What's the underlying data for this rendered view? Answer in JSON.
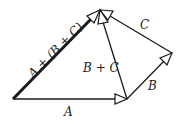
{
  "labels": {
    "A": "A",
    "B": "B",
    "C": "C",
    "B_plus_C": "B + C",
    "A_plus_B_plus_C": "A + (B + C)"
  },
  "vectors": [
    {
      "name": "A",
      "from": [
        13,
        99
      ],
      "to": [
        127,
        99
      ]
    },
    {
      "name": "B",
      "from": [
        127,
        99
      ],
      "to": [
        172,
        53
      ]
    },
    {
      "name": "C",
      "from": [
        172,
        53
      ],
      "to": [
        100,
        10
      ]
    },
    {
      "name": "B + C",
      "from": [
        127,
        99
      ],
      "to": [
        100,
        10
      ]
    },
    {
      "name": "A + (B + C)",
      "from": [
        13,
        99
      ],
      "to": [
        100,
        10
      ],
      "bold": true
    }
  ],
  "colors": {
    "stroke": "#1a1a1a",
    "background": "#ffffff"
  }
}
